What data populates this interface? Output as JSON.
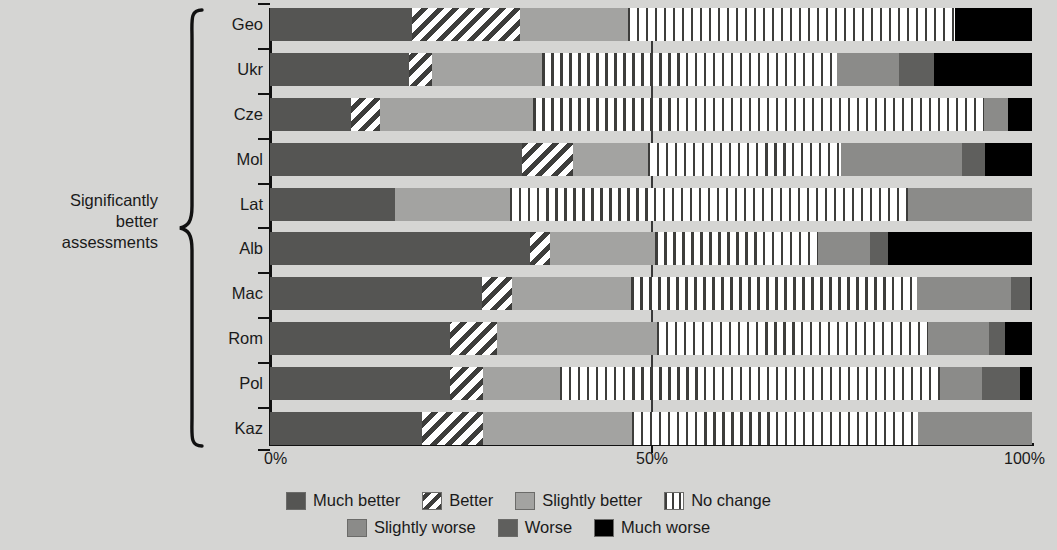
{
  "annotation": {
    "brace_label_line1": "Significantly",
    "brace_label_line2": "better",
    "brace_label_line3": "assessments"
  },
  "axis": {
    "ticks": [
      "0%",
      "50%",
      "100%"
    ],
    "tick_0": "0%",
    "tick_50": "50%",
    "tick_100": "100%"
  },
  "legend": {
    "row1": [
      {
        "label": "Much better",
        "key": "much_better",
        "color": "#555553"
      },
      {
        "label": "Better",
        "key": "better",
        "color": "#ffffff"
      },
      {
        "label": "Slightly better",
        "key": "slightly_better",
        "color": "#a3a3a1"
      },
      {
        "label": "No change",
        "key": "no_change",
        "color": "#ffffff"
      }
    ],
    "row2": [
      {
        "label": "Slightly worse",
        "key": "slightly_worse",
        "color": "#8b8b89"
      },
      {
        "label": "Worse",
        "key": "worse",
        "color": "#5f5f5d"
      },
      {
        "label": "Much worse",
        "key": "much_worse",
        "color": "#000000"
      }
    ]
  },
  "chart_data": {
    "type": "bar",
    "orientation": "horizontal",
    "stacked": true,
    "normalized": true,
    "title": "",
    "xlabel": "",
    "ylabel": "",
    "xlim": [
      0,
      100
    ],
    "xticks": [
      0,
      50,
      100
    ],
    "grid": false,
    "midline_at": 50,
    "legend_position": "bottom",
    "categories": [
      "Geo",
      "Ukr",
      "Cze",
      "Mol",
      "Lat",
      "Alb",
      "Mac",
      "Rom",
      "Pol",
      "Kaz"
    ],
    "series": [
      {
        "name": "Much better",
        "values": [
          18.6,
          18.2,
          10.6,
          33.1,
          16.4,
          34.1,
          27.8,
          23.6,
          23.6,
          19.9
        ]
      },
      {
        "name": "Better",
        "values": [
          14.2,
          3.1,
          3.8,
          6.7,
          0.0,
          2.6,
          3.9,
          6.2,
          4.3,
          8.0
        ]
      },
      {
        "name": "Slightly better",
        "values": [
          14.2,
          14.4,
          20.1,
          9.8,
          15.1,
          13.8,
          15.7,
          21.0,
          10.1,
          19.6
        ]
      },
      {
        "name": "No change",
        "values": [
          42.9,
          38.7,
          59.2,
          25.3,
          52.2,
          21.4,
          37.5,
          35.6,
          49.9,
          37.5
        ]
      },
      {
        "name": "Slightly worse",
        "values": [
          0.0,
          8.1,
          3.1,
          15.9,
          16.3,
          6.8,
          12.3,
          7.9,
          5.6,
          15.0
        ]
      },
      {
        "name": "Worse",
        "values": [
          0.0,
          4.6,
          0.0,
          3.0,
          0.0,
          2.4,
          2.6,
          2.2,
          4.9,
          0.0
        ]
      },
      {
        "name": "Much worse",
        "values": [
          10.1,
          12.9,
          3.2,
          6.2,
          0.0,
          18.9,
          0.2,
          3.5,
          1.6,
          0.0
        ]
      }
    ]
  }
}
